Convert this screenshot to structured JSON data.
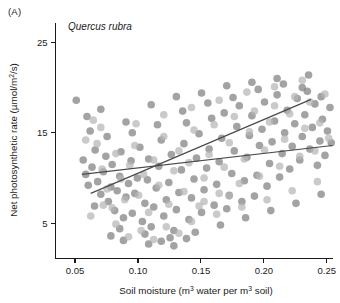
{
  "figure": {
    "panel_label": "(A)",
    "species_title": "Quercus rubra",
    "background_color": "#ffffff"
  },
  "chart_data": {
    "type": "scatter",
    "title": "Quercus rubra",
    "panel": "(A)",
    "xlabel": "Soil moisture (m3 water per m3 soil)",
    "xlabel_parts": {
      "pre": "Soil moisture (m",
      "sup1": "3",
      "mid": " water per m",
      "sup2": "3",
      "post": " soil)"
    },
    "ylabel": "Net photosynthetic rate (umol/m2/s)",
    "ylabel_parts": {
      "pre": "Net photosynthetic rate (µmol/m",
      "sup": "2",
      "post": "/s)"
    },
    "xlim": [
      0.0345,
      0.2545
    ],
    "ylim": [
      1.1,
      27.2
    ],
    "xticks": [
      0.05,
      0.1,
      0.15,
      0.2,
      0.25
    ],
    "xticklabels": [
      "0.05",
      "0.10",
      "0.15",
      "0.20",
      "0.25"
    ],
    "yticks": [
      5,
      15,
      25
    ],
    "yticklabels": [
      "5",
      "15",
      "25"
    ],
    "grid": false,
    "legend": "none",
    "series": [
      {
        "name": "dark-points",
        "color": "#808080",
        "opacity": 0.72,
        "marker": "circle",
        "marker_size": 7.6,
        "points": [
          [
            0.051,
            18.6
          ],
          [
            0.062,
            15.2
          ],
          [
            0.0565,
            12.0
          ],
          [
            0.0585,
            10.4
          ],
          [
            0.0605,
            9.2
          ],
          [
            0.0635,
            11.2
          ],
          [
            0.066,
            13.1
          ],
          [
            0.068,
            9.6
          ],
          [
            0.0705,
            8.2
          ],
          [
            0.0725,
            10.7
          ],
          [
            0.0745,
            12.4
          ],
          [
            0.0765,
            7.4
          ],
          [
            0.0785,
            9.0
          ],
          [
            0.0795,
            11.5
          ],
          [
            0.0815,
            6.4
          ],
          [
            0.0835,
            8.6
          ],
          [
            0.0855,
            10.2
          ],
          [
            0.0865,
            12.9
          ],
          [
            0.0885,
            5.6
          ],
          [
            0.0905,
            7.9
          ],
          [
            0.0925,
            9.4
          ],
          [
            0.0945,
            11.9
          ],
          [
            0.0955,
            6.1
          ],
          [
            0.0975,
            8.3
          ],
          [
            0.0995,
            10.0
          ],
          [
            0.1015,
            13.4
          ],
          [
            0.1035,
            5.2
          ],
          [
            0.1055,
            7.2
          ],
          [
            0.1075,
            9.8
          ],
          [
            0.1085,
            12.1
          ],
          [
            0.1105,
            4.6
          ],
          [
            0.1125,
            6.8
          ],
          [
            0.1145,
            8.9
          ],
          [
            0.1165,
            11.3
          ],
          [
            0.1185,
            14.2
          ],
          [
            0.1205,
            5.8
          ],
          [
            0.1225,
            7.6
          ],
          [
            0.1245,
            9.5
          ],
          [
            0.1265,
            12.6
          ],
          [
            0.1285,
            4.2
          ],
          [
            0.1305,
            6.5
          ],
          [
            0.1325,
            8.4
          ],
          [
            0.1345,
            10.9
          ],
          [
            0.1365,
            13.8
          ],
          [
            0.1385,
            16.1
          ],
          [
            0.1405,
            5.4
          ],
          [
            0.1425,
            7.8
          ],
          [
            0.1445,
            9.9
          ],
          [
            0.1465,
            12.2
          ],
          [
            0.1485,
            14.9
          ],
          [
            0.1505,
            6.2
          ],
          [
            0.1525,
            8.7
          ],
          [
            0.1545,
            11.1
          ],
          [
            0.1565,
            13.2
          ],
          [
            0.1585,
            16.6
          ],
          [
            0.1605,
            7.0
          ],
          [
            0.1625,
            9.3
          ],
          [
            0.1645,
            11.8
          ],
          [
            0.1665,
            14.4
          ],
          [
            0.1685,
            17.2
          ],
          [
            0.1705,
            6.6
          ],
          [
            0.1725,
            8.1
          ],
          [
            0.1745,
            10.5
          ],
          [
            0.1765,
            13.0
          ],
          [
            0.1785,
            15.7
          ],
          [
            0.1805,
            18.0
          ],
          [
            0.1825,
            7.4
          ],
          [
            0.1845,
            9.7
          ],
          [
            0.1865,
            12.3
          ],
          [
            0.1885,
            14.7
          ],
          [
            0.1905,
            16.9
          ],
          [
            0.1925,
            8.0
          ],
          [
            0.1945,
            10.3
          ],
          [
            0.1965,
            13.6
          ],
          [
            0.1985,
            15.4
          ],
          [
            0.2005,
            18.4
          ],
          [
            0.2025,
            9.1
          ],
          [
            0.2045,
            11.6
          ],
          [
            0.2065,
            14.0
          ],
          [
            0.2085,
            16.3
          ],
          [
            0.2105,
            19.2
          ],
          [
            0.2125,
            10.1
          ],
          [
            0.2145,
            12.7
          ],
          [
            0.2165,
            15.0
          ],
          [
            0.2185,
            17.5
          ],
          [
            0.2205,
            11.0
          ],
          [
            0.2225,
            13.5
          ],
          [
            0.2245,
            16.0
          ],
          [
            0.2265,
            18.8
          ],
          [
            0.2285,
            12.0
          ],
          [
            0.2305,
            14.6
          ],
          [
            0.2325,
            17.0
          ],
          [
            0.2345,
            19.6
          ],
          [
            0.2365,
            13.2
          ],
          [
            0.2385,
            15.6
          ],
          [
            0.2405,
            18.2
          ],
          [
            0.2425,
            11.4
          ],
          [
            0.2445,
            14.1
          ],
          [
            0.2465,
            16.5
          ],
          [
            0.2485,
            12.5
          ],
          [
            0.2505,
            15.2
          ],
          [
            0.2525,
            17.8
          ],
          [
            0.2535,
            13.9
          ],
          [
            0.0595,
            16.8
          ],
          [
            0.0705,
            17.6
          ],
          [
            0.0905,
            16.2
          ],
          [
            0.1105,
            18.1
          ],
          [
            0.1305,
            19.0
          ],
          [
            0.1505,
            19.4
          ],
          [
            0.1705,
            20.2
          ],
          [
            0.1905,
            20.6
          ],
          [
            0.2105,
            21.0
          ],
          [
            0.2305,
            20.0
          ],
          [
            0.2455,
            19.0
          ],
          [
            0.0755,
            14.6
          ],
          [
            0.0955,
            15.0
          ],
          [
            0.1155,
            15.9
          ],
          [
            0.1355,
            17.4
          ],
          [
            0.1555,
            18.3
          ],
          [
            0.1755,
            18.9
          ],
          [
            0.1955,
            19.8
          ],
          [
            0.2155,
            20.4
          ],
          [
            0.2355,
            21.4
          ],
          [
            0.0655,
            6.9
          ],
          [
            0.0855,
            4.4
          ],
          [
            0.1055,
            3.8
          ],
          [
            0.1255,
            3.4
          ],
          [
            0.1455,
            4.0
          ],
          [
            0.1655,
            4.8
          ],
          [
            0.1855,
            5.6
          ],
          [
            0.2055,
            6.4
          ],
          [
            0.2255,
            7.2
          ],
          [
            0.2455,
            8.2
          ],
          [
            0.0885,
            3.1
          ],
          [
            0.1085,
            2.7
          ],
          [
            0.1285,
            2.5
          ],
          [
            0.0785,
            3.6
          ],
          [
            0.1185,
            3.0
          ],
          [
            0.1385,
            3.3
          ]
        ]
      },
      {
        "name": "light-points",
        "color": "#b5b5b5",
        "opacity": 0.72,
        "marker": "circle",
        "marker_size": 7.6,
        "points": [
          [
            0.0645,
            16.4
          ],
          [
            0.0675,
            13.8
          ],
          [
            0.0715,
            11.0
          ],
          [
            0.0755,
            8.8
          ],
          [
            0.0795,
            6.7
          ],
          [
            0.0825,
            12.7
          ],
          [
            0.0865,
            9.9
          ],
          [
            0.0895,
            7.6
          ],
          [
            0.0935,
            11.4
          ],
          [
            0.0975,
            13.6
          ],
          [
            0.1005,
            8.1
          ],
          [
            0.1045,
            10.4
          ],
          [
            0.1085,
            6.2
          ],
          [
            0.1125,
            12.0
          ],
          [
            0.1165,
            9.2
          ],
          [
            0.1205,
            14.6
          ],
          [
            0.1245,
            7.1
          ],
          [
            0.1285,
            10.8
          ],
          [
            0.1325,
            13.0
          ],
          [
            0.1365,
            8.5
          ],
          [
            0.1405,
            11.7
          ],
          [
            0.1445,
            15.3
          ],
          [
            0.1485,
            6.9
          ],
          [
            0.1525,
            10.0
          ],
          [
            0.1565,
            12.6
          ],
          [
            0.1605,
            15.9
          ],
          [
            0.1645,
            8.3
          ],
          [
            0.1685,
            11.2
          ],
          [
            0.1725,
            13.9
          ],
          [
            0.1765,
            16.8
          ],
          [
            0.1805,
            9.4
          ],
          [
            0.1845,
            12.1
          ],
          [
            0.1885,
            15.1
          ],
          [
            0.1925,
            17.4
          ],
          [
            0.1965,
            10.2
          ],
          [
            0.2005,
            13.1
          ],
          [
            0.2045,
            16.2
          ],
          [
            0.2085,
            18.0
          ],
          [
            0.2125,
            11.3
          ],
          [
            0.2165,
            14.3
          ],
          [
            0.2205,
            17.1
          ],
          [
            0.2245,
            19.0
          ],
          [
            0.2285,
            12.4
          ],
          [
            0.2325,
            15.5
          ],
          [
            0.2365,
            18.4
          ],
          [
            0.2405,
            13.0
          ],
          [
            0.2445,
            16.1
          ],
          [
            0.2485,
            19.3
          ],
          [
            0.2515,
            14.4
          ],
          [
            0.0585,
            14.2
          ],
          [
            0.0705,
            15.6
          ],
          [
            0.0985,
            16.0
          ],
          [
            0.1205,
            17.0
          ],
          [
            0.1425,
            17.8
          ],
          [
            0.1645,
            18.6
          ],
          [
            0.1865,
            19.5
          ],
          [
            0.2085,
            20.1
          ],
          [
            0.2305,
            20.8
          ],
          [
            0.0625,
            5.8
          ],
          [
            0.0825,
            4.9
          ],
          [
            0.1025,
            4.2
          ],
          [
            0.1225,
            4.6
          ],
          [
            0.1425,
            5.2
          ],
          [
            0.1625,
            6.0
          ],
          [
            0.1825,
            6.8
          ],
          [
            0.2025,
            7.6
          ],
          [
            0.2225,
            8.6
          ],
          [
            0.2425,
            9.6
          ],
          [
            0.0925,
            3.5
          ],
          [
            0.1125,
            3.2
          ],
          [
            0.1325,
            3.9
          ],
          [
            0.0725,
            7.0
          ],
          [
            0.1525,
            7.4
          ],
          [
            0.1725,
            8.0
          ]
        ]
      }
    ],
    "fit_lines": [
      {
        "name": "steep-regression-line",
        "color": "#4a4a4a",
        "x0": 0.0625,
        "y0": 8.3,
        "x1": 0.2375,
        "y1": 18.7
      },
      {
        "name": "shallow-regression-line",
        "color": "#4a4a4a",
        "x0": 0.0555,
        "y0": 10.4,
        "x1": 0.2545,
        "y1": 13.6
      }
    ]
  }
}
